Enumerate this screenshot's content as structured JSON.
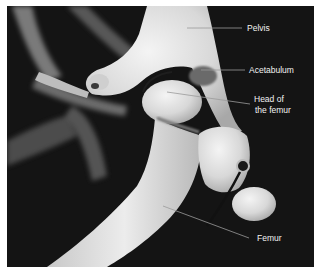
{
  "figure": {
    "type": "labeled anatomical photograph",
    "background_color": "#141414",
    "label_color": "#f2f2f2",
    "leader_line_color": "#9a9a9a"
  },
  "labels": [
    {
      "id": "pelvis",
      "text": "Pelvis"
    },
    {
      "id": "acetabulum",
      "text": "Acetabulum"
    },
    {
      "id": "head_line1",
      "text": "Head of"
    },
    {
      "id": "head_line2",
      "text": "the femur"
    },
    {
      "id": "femur",
      "text": "Femur"
    }
  ]
}
